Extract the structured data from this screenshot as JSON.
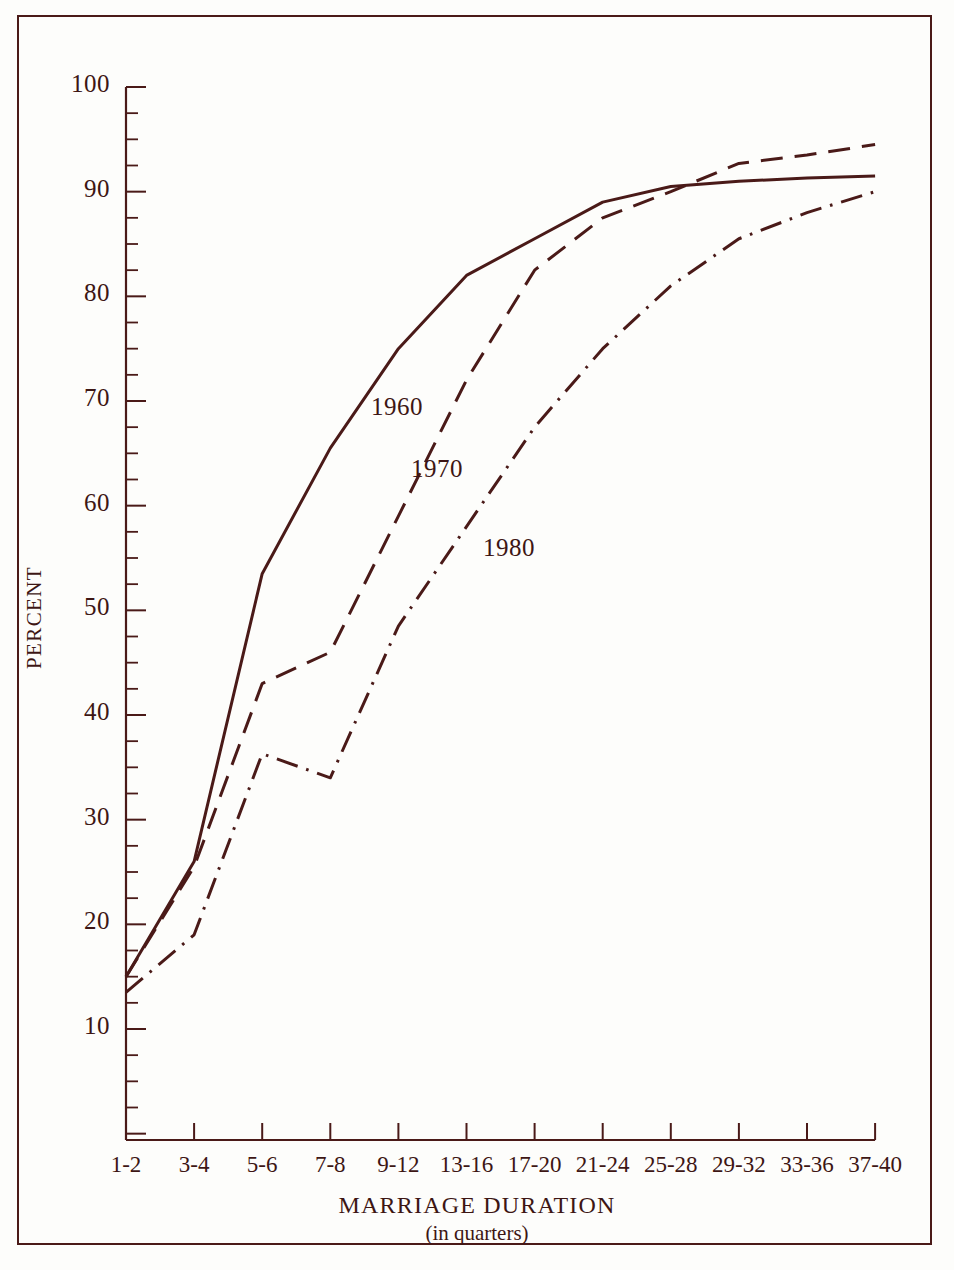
{
  "chart_data": {
    "type": "line",
    "title": "",
    "subtitle": "",
    "xlabel": "MARRIAGE  DURATION",
    "xlabel_sub": "(in quarters)",
    "ylabel": "PERCENT",
    "ylim": [
      0,
      100
    ],
    "ytick_step": 10,
    "yticks": [
      100,
      90,
      80,
      70,
      60,
      50,
      40,
      30,
      20,
      10
    ],
    "ytick_labels": [
      "100",
      "90",
      "80",
      "70",
      "60",
      "50",
      "40",
      "30",
      "20",
      "10"
    ],
    "yminor_step": 2.5,
    "grid": false,
    "legend_position": "inline-annotations",
    "categories": [
      "1-2",
      "3-4",
      "5-6",
      "7-8",
      "9-12",
      "13-16",
      "17-20",
      "21-24",
      "25-28",
      "29-32",
      "33-36",
      "37-40"
    ],
    "series": [
      {
        "name": "1960",
        "style": "solid",
        "color": "#4a1a18",
        "values": [
          15.0,
          26.0,
          53.5,
          65.5,
          75.0,
          82.0,
          85.5,
          89.0,
          90.5,
          91.0,
          91.3,
          91.5
        ]
      },
      {
        "name": "1970",
        "style": "dashed",
        "color": "#4a1a18",
        "values": [
          15.0,
          25.5,
          43.0,
          46.0,
          59.0,
          72.0,
          82.5,
          87.5,
          90.0,
          92.7,
          93.5,
          94.5
        ]
      },
      {
        "name": "1980",
        "style": "dash-dot",
        "color": "#4a1a18",
        "values": [
          13.5,
          19.0,
          36.3,
          34.0,
          48.5,
          58.0,
          67.5,
          75.0,
          81.0,
          85.5,
          88.0,
          90.0
        ]
      }
    ],
    "annotations": [
      {
        "text": "1960",
        "x_px": 371,
        "y_px": 393
      },
      {
        "text": "1970",
        "x_px": 411,
        "y_px": 455
      },
      {
        "text": "1980",
        "x_px": 483,
        "y_px": 534
      }
    ]
  },
  "colors": {
    "ink": "#4a1a18",
    "text": "#3d1614",
    "background": "#fdfdfb",
    "frame": "#4a1a18"
  }
}
